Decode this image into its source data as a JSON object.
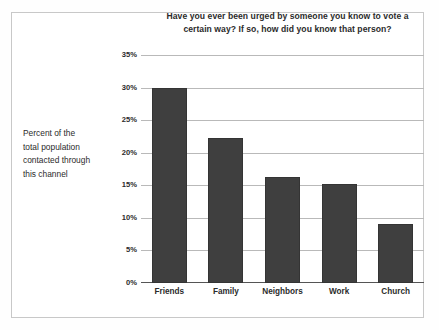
{
  "figure": {
    "background_color": "#ffffff",
    "border_color": "#c8c8c8"
  },
  "ylabel_lines": [
    "Percent of the",
    "total population",
    "contacted through",
    "this channel"
  ],
  "title_lines": [
    "Have you ever been urged by someone you know to vote a",
    "certain way? If so, how did you know that person?"
  ],
  "chart_data": {
    "type": "bar",
    "title": "Have you ever been urged by someone you know to vote a certain way? If so, how did you know that person?",
    "xlabel": "",
    "ylabel": "Percent of the total population contacted through this channel",
    "categories": [
      "Friends",
      "Family",
      "Neighbors",
      "Work",
      "Church"
    ],
    "values": [
      30.0,
      22.3,
      16.3,
      15.2,
      9.1
    ],
    "ylim": [
      0,
      35
    ],
    "ytick_labels": [
      "35%",
      "30%",
      "25%",
      "20%",
      "15%",
      "10%",
      "5%",
      "0%"
    ],
    "ytick_values": [
      35,
      30,
      25,
      20,
      15,
      10,
      5,
      0
    ],
    "grid": true,
    "legend": false,
    "bar_color": "#3f3f3f",
    "gridline_color": "#b9b9b9",
    "axis_color": "#555555"
  }
}
